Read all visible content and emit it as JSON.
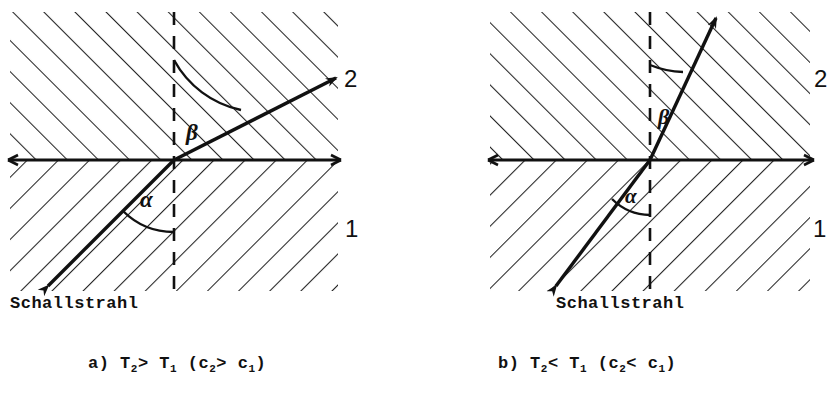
{
  "figure": {
    "type": "physics-diagram",
    "panels": [
      {
        "id": "a",
        "caption_prefix": "a)",
        "caption_main": "T",
        "caption_sub1": "2",
        "caption_rel1": ">",
        "caption_main2": "T",
        "caption_sub2": "1",
        "caption_paren_open": "(c",
        "caption_sub3": "2",
        "caption_rel2": ">",
        "caption_main3": "c",
        "caption_sub4": "1",
        "caption_paren_close": ")",
        "caption_text": "a) T2> T1 (c2> c1)",
        "ray_source_label": "Schallstrahl",
        "medium_lower_label": "1",
        "medium_upper_label": "2",
        "angle_incidence_label": "α",
        "angle_refraction_label": "β",
        "angle_incidence_deg": 45,
        "angle_refraction_deg": 70,
        "origin": {
          "x": 174,
          "y": 160
        },
        "incident_tail": {
          "x": 48,
          "y": 286
        },
        "refracted_head": {
          "x": 336,
          "y": 78
        },
        "normal_top": {
          "x": 174,
          "y": 12
        },
        "normal_bottom": {
          "x": 174,
          "y": 292
        },
        "interface_left": {
          "x": 8,
          "y": 160
        },
        "interface_right": {
          "x": 341,
          "y": 160
        },
        "region_left": 10,
        "region_right": 338,
        "region_top": 12,
        "region_bottom": 291,
        "label1_pos": {
          "x": 348,
          "y": 228
        },
        "label2_pos": {
          "x": 344,
          "y": 78
        }
      },
      {
        "id": "b",
        "caption_prefix": "b)",
        "caption_main": "T",
        "caption_sub1": "2",
        "caption_rel1": "<",
        "caption_main2": "T",
        "caption_sub2": "1",
        "caption_paren_open": "(c",
        "caption_sub3": "2",
        "caption_rel2": "<",
        "caption_main3": "c",
        "caption_sub4": "1",
        "caption_paren_close": ")",
        "caption_text": "b) T2< T1 (c2< c1)",
        "ray_source_label": "Schallstrahl",
        "medium_lower_label": "1",
        "medium_upper_label": "2",
        "angle_incidence_label": "α",
        "angle_refraction_label": "β",
        "angle_incidence_deg": 45,
        "angle_refraction_deg": 20,
        "origin": {
          "x": 650,
          "y": 160
        },
        "incident_tail": {
          "x": 556,
          "y": 286
        },
        "refracted_head": {
          "x": 716,
          "y": 18
        },
        "normal_top": {
          "x": 650,
          "y": 12
        },
        "normal_bottom": {
          "x": 650,
          "y": 292
        },
        "interface_left": {
          "x": 490,
          "y": 160
        },
        "interface_right": {
          "x": 812,
          "y": 160
        },
        "region_left": 490,
        "region_right": 810,
        "region_top": 12,
        "region_bottom": 291,
        "label1_pos": {
          "x": 814,
          "y": 228
        },
        "label2_pos": {
          "x": 816,
          "y": 78
        }
      }
    ],
    "style": {
      "ink": "#111111",
      "hatch": "#222222",
      "background": "#ffffff",
      "hatch_upper_direction": "up-right",
      "hatch_lower_direction": "down-right"
    }
  }
}
